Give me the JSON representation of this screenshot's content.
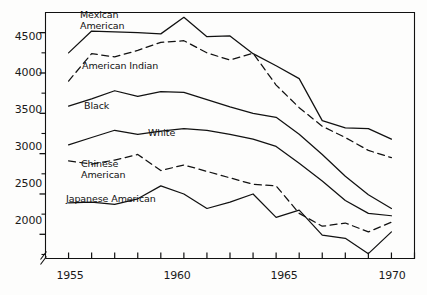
{
  "chart_data": {
    "type": "line",
    "title": "",
    "subtitle": "",
    "xlabel": "",
    "ylabel": "",
    "xlim": [
      1954,
      1970
    ],
    "ylim": [
      1700,
      4750
    ],
    "grid": false,
    "legend_position": "inline-labels",
    "x": [
      1955,
      1956,
      1957,
      1958,
      1959,
      1960,
      1961,
      1962,
      1963,
      1964,
      1965,
      1966,
      1967,
      1968,
      1969
    ],
    "x_tick_values": [
      1955,
      1956,
      1957,
      1958,
      1959,
      1960,
      1961,
      1962,
      1963,
      1964,
      1965,
      1966,
      1967,
      1968,
      1969,
      1970
    ],
    "x_tick_labels": [
      "1955",
      "",
      "",
      "",
      "",
      "1960",
      "",
      "",
      "",
      "",
      "1965",
      "",
      "",
      "",
      "",
      "1970"
    ],
    "x_major_labels": [
      "1955",
      "1960",
      "1965",
      "1970"
    ],
    "y_tick_major": [
      2000,
      2500,
      3000,
      3500,
      4000,
      4500
    ],
    "y_tick_minor": [
      1750,
      2250,
      2750,
      3250,
      3750,
      4250
    ],
    "y_tick_labels": [
      "2000",
      "2500",
      "3000",
      "3500",
      "4000",
      "4500"
    ],
    "axis_break": true,
    "series": [
      {
        "name": "Mexican American",
        "style": "solid",
        "label_lines": [
          "Mexican",
          "American"
        ],
        "values": [
          4250,
          4520,
          4510,
          4500,
          4485,
          4690,
          4450,
          4460,
          4240,
          4090,
          3930,
          3410,
          3320,
          3310,
          3180
        ]
      },
      {
        "name": "American Indian",
        "style": "dashed",
        "label_lines": [
          "American Indian"
        ],
        "values": [
          3900,
          4240,
          4200,
          4280,
          4380,
          4400,
          4250,
          4160,
          4245,
          3850,
          3570,
          3340,
          3200,
          3040,
          2950
        ]
      },
      {
        "name": "Black",
        "style": "solid",
        "label_lines": [
          "Black"
        ],
        "values": [
          3590,
          3680,
          3780,
          3710,
          3770,
          3760,
          3670,
          3580,
          3500,
          3450,
          3240,
          2990,
          2720,
          2490,
          2320
        ]
      },
      {
        "name": "White",
        "style": "solid",
        "label_lines": [
          "White"
        ],
        "values": [
          3110,
          3200,
          3290,
          3240,
          3280,
          3310,
          3290,
          3240,
          3180,
          3090,
          2880,
          2660,
          2420,
          2260,
          2230
        ]
      },
      {
        "name": "Chinese American",
        "style": "dashed",
        "label_lines": [
          "Chinese",
          "American"
        ],
        "values": [
          2910,
          2870,
          2920,
          2990,
          2790,
          2860,
          2780,
          2700,
          2620,
          2600,
          2260,
          2100,
          2140,
          2030,
          2150
        ]
      },
      {
        "name": "Japanese American",
        "style": "solid",
        "label_lines": [
          "Japanese American"
        ],
        "values": [
          2390,
          2400,
          2370,
          2440,
          2600,
          2500,
          2320,
          2400,
          2500,
          2210,
          2300,
          1990,
          1950,
          1760,
          2030
        ]
      }
    ]
  },
  "axis": {
    "y_labels": [
      "4500",
      "4000",
      "3500",
      "3000",
      "2500",
      "2000"
    ],
    "x_labels": [
      "1955",
      "1960",
      "1965",
      "1970"
    ]
  },
  "series_labels": {
    "mexican_american": "Mexican\nAmerican",
    "american_indian": "American Indian",
    "black": "Black",
    "white": "White",
    "chinese_american": "Chinese\nAmerican",
    "japanese_american": "Japanese American"
  },
  "colors": {
    "line": "#111111",
    "axis": "#111111",
    "text": "#1a1a1a",
    "background": "#fdfdfc"
  }
}
